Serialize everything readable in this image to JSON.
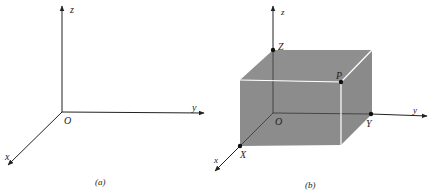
{
  "figure_a": {
    "caption": "(a)",
    "axis_labels": {
      "z": "z",
      "y": "y",
      "x": "x"
    },
    "origin_label": "O"
  },
  "figure_b": {
    "caption": "(b)",
    "axis_labels": {
      "z": "z",
      "y": "y",
      "x": "x"
    },
    "origin_label": "O",
    "points": {
      "Z": "Z",
      "P": "P",
      "Y": "Y",
      "X": "X"
    },
    "box_color": "#8a8a8a"
  }
}
